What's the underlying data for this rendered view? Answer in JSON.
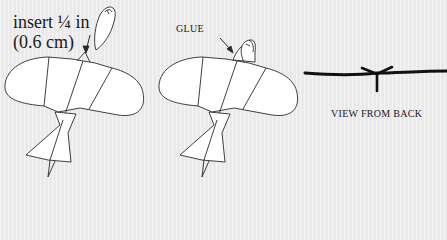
{
  "figure": {
    "step1": {
      "label_line1": "insert ¼ in",
      "label_line2": "(0.6 cm)"
    },
    "step2": {
      "label": "GLUE"
    },
    "step3": {
      "label": "VIEW FROM BACK"
    }
  },
  "colors": {
    "background": "#ececec",
    "line": "#2a2a2a",
    "fill": "#ffffff"
  }
}
